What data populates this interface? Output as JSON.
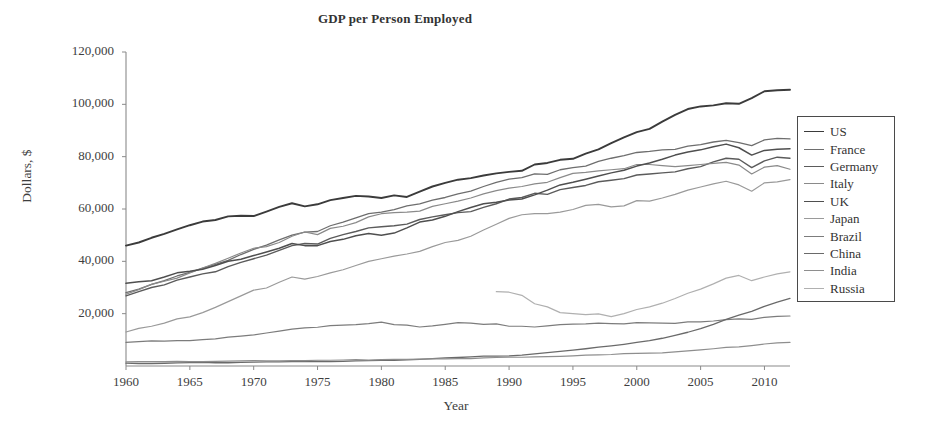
{
  "chart_data": {
    "type": "line",
    "title": "GDP per Person Employed",
    "xlabel": "Year",
    "ylabel": "Dollars, $",
    "xlim": [
      1960,
      2012
    ],
    "ylim": [
      0,
      120000
    ],
    "grid": false,
    "legend_position": "right-outside",
    "xticks": [
      1960,
      1965,
      1970,
      1975,
      1980,
      1985,
      1990,
      1995,
      2000,
      2005,
      2010
    ],
    "xtick_labels": [
      "1960",
      "1965",
      "1970",
      "1975",
      "1980",
      "1985",
      "1990",
      "1995",
      "2000",
      "2005",
      "2010"
    ],
    "yticks": [
      20000,
      40000,
      60000,
      80000,
      100000,
      120000
    ],
    "ytick_labels": [
      "20,000",
      "40,000",
      "60,000",
      "80,000",
      "100,000",
      "120,000"
    ],
    "x": [
      1960,
      1961,
      1962,
      1963,
      1964,
      1965,
      1966,
      1967,
      1968,
      1969,
      1970,
      1971,
      1972,
      1973,
      1974,
      1975,
      1976,
      1977,
      1978,
      1979,
      1980,
      1981,
      1982,
      1983,
      1984,
      1985,
      1986,
      1987,
      1988,
      1989,
      1990,
      1991,
      1992,
      1993,
      1994,
      1995,
      1996,
      1997,
      1998,
      1999,
      2000,
      2001,
      2002,
      2003,
      2004,
      2005,
      2006,
      2007,
      2008,
      2009,
      2010,
      2011,
      2012
    ],
    "series": [
      {
        "name": "US",
        "color": "#3b3b3b",
        "width": 1.9,
        "values": [
          46000,
          47200,
          49000,
          50500,
          52200,
          53800,
          55200,
          55800,
          57200,
          57400,
          57300,
          59000,
          60800,
          62200,
          61000,
          61800,
          63400,
          64200,
          65000,
          64800,
          64200,
          65200,
          64600,
          66600,
          68600,
          70000,
          71200,
          71800,
          72800,
          73600,
          74200,
          74600,
          77000,
          77600,
          78800,
          79200,
          81200,
          82800,
          85200,
          87400,
          89400,
          90600,
          93400,
          96000,
          98200,
          99200,
          99600,
          100400,
          100200,
          102400,
          105000,
          105400,
          105600
        ]
      },
      {
        "name": "France",
        "color": "#6e6e6e",
        "width": 1.3,
        "values": [
          28000,
          29400,
          31200,
          32600,
          34400,
          35800,
          37400,
          38800,
          40400,
          42600,
          44600,
          46200,
          48200,
          50000,
          51200,
          51400,
          53600,
          55000,
          56600,
          58200,
          58800,
          59800,
          61200,
          62000,
          63400,
          64400,
          65800,
          66800,
          68600,
          70200,
          71400,
          72000,
          73400,
          73200,
          75000,
          75800,
          76400,
          78200,
          79400,
          80400,
          81600,
          82000,
          82600,
          82800,
          84000,
          84600,
          85600,
          86200,
          85400,
          84200,
          86400,
          87000,
          86800
        ]
      },
      {
        "name": "Germany",
        "color": "#5b5b5b",
        "width": 1.4,
        "values": [
          26800,
          28400,
          30000,
          31000,
          32800,
          34000,
          35200,
          36000,
          38000,
          39600,
          41000,
          42400,
          44200,
          46000,
          46800,
          46600,
          48800,
          50200,
          51400,
          52800,
          53200,
          53600,
          54200,
          56000,
          57000,
          57800,
          58600,
          59000,
          60600,
          62000,
          63800,
          64400,
          66000,
          65600,
          67400,
          68200,
          69000,
          70400,
          71000,
          71600,
          73000,
          73400,
          73800,
          74200,
          75400,
          76200,
          78000,
          79400,
          79000,
          75800,
          78400,
          79800,
          79400
        ]
      },
      {
        "name": "Italy",
        "color": "#8a8a8a",
        "width": 1.2,
        "values": [
          27400,
          29200,
          31200,
          32400,
          33600,
          35600,
          37400,
          39200,
          41200,
          43200,
          45000,
          45600,
          47200,
          49600,
          51200,
          50200,
          52600,
          53400,
          54800,
          57000,
          58200,
          58600,
          58800,
          59200,
          61000,
          62000,
          63000,
          64200,
          65800,
          67000,
          68000,
          68600,
          69600,
          70200,
          72000,
          73600,
          74000,
          74600,
          75000,
          75400,
          77000,
          77000,
          76600,
          76200,
          76600,
          77000,
          77400,
          77800,
          76800,
          73400,
          76000,
          76600,
          75200
        ]
      },
      {
        "name": "UK",
        "color": "#4f4f4f",
        "width": 1.5,
        "values": [
          31600,
          32200,
          32600,
          34000,
          35600,
          36200,
          37000,
          38400,
          40000,
          40800,
          42200,
          43600,
          45000,
          46800,
          46000,
          46000,
          47600,
          48400,
          49800,
          50600,
          50000,
          50800,
          52800,
          55000,
          55800,
          57200,
          59000,
          60600,
          62000,
          62600,
          63400,
          63800,
          65400,
          67200,
          69200,
          70200,
          71400,
          72600,
          73800,
          74800,
          76400,
          77600,
          79000,
          80600,
          81800,
          82600,
          83800,
          84800,
          83400,
          80600,
          82400,
          82800,
          83000
        ]
      },
      {
        "name": "Japan",
        "color": "#9a9a9a",
        "width": 1.2,
        "values": [
          13000,
          14400,
          15200,
          16400,
          18000,
          18800,
          20400,
          22400,
          24600,
          26800,
          29000,
          29800,
          32000,
          34000,
          33200,
          34200,
          35600,
          36800,
          38400,
          40000,
          41000,
          42000,
          42800,
          43800,
          45600,
          47200,
          48000,
          49600,
          52000,
          54200,
          56400,
          57800,
          58200,
          58200,
          58800,
          59800,
          61400,
          61800,
          60800,
          61200,
          63200,
          63000,
          64200,
          65600,
          67200,
          68400,
          69600,
          70600,
          69200,
          66800,
          70000,
          70400,
          71200
        ]
      },
      {
        "name": "Brazil",
        "color": "#7c7c7c",
        "width": 1.2,
        "values": [
          9000,
          9300,
          9600,
          9500,
          9700,
          9700,
          10100,
          10400,
          11000,
          11400,
          11900,
          12600,
          13300,
          14100,
          14600,
          14800,
          15400,
          15600,
          15800,
          16200,
          16800,
          15800,
          15600,
          14900,
          15300,
          15900,
          16600,
          16400,
          15900,
          16100,
          15200,
          15200,
          14900,
          15300,
          15800,
          16000,
          16100,
          16400,
          16200,
          16100,
          16600,
          16500,
          16400,
          16300,
          16900,
          16900,
          17200,
          17700,
          18000,
          17800,
          18600,
          19000,
          19100
        ]
      },
      {
        "name": "China",
        "color": "#6a6a6a",
        "width": 1.3,
        "values": [
          1100,
          950,
          950,
          1050,
          1200,
          1300,
          1350,
          1250,
          1250,
          1350,
          1500,
          1550,
          1550,
          1650,
          1650,
          1750,
          1700,
          1800,
          1950,
          2050,
          2150,
          2200,
          2350,
          2550,
          2850,
          3100,
          3250,
          3500,
          3750,
          3800,
          3850,
          4150,
          4650,
          5100,
          5600,
          6100,
          6600,
          7200,
          7700,
          8300,
          9000,
          9700,
          10600,
          11700,
          12900,
          14300,
          15900,
          17800,
          19400,
          20900,
          22800,
          24400,
          25800
        ]
      },
      {
        "name": "India",
        "color": "#8e8e8e",
        "width": 1.2,
        "values": [
          1600,
          1650,
          1650,
          1700,
          1800,
          1700,
          1700,
          1800,
          1850,
          1950,
          2050,
          2000,
          2000,
          2050,
          2050,
          2200,
          2200,
          2300,
          2400,
          2250,
          2400,
          2500,
          2500,
          2650,
          2700,
          2750,
          2850,
          2850,
          3100,
          3250,
          3400,
          3350,
          3450,
          3550,
          3700,
          3900,
          4150,
          4250,
          4400,
          4700,
          4800,
          4950,
          5050,
          5400,
          5750,
          6150,
          6600,
          7100,
          7300,
          7800,
          8400,
          8800,
          9000
        ]
      },
      {
        "name": "Russia",
        "color": "#b0b0b0",
        "width": 1.2,
        "values": [
          null,
          null,
          null,
          null,
          null,
          null,
          null,
          null,
          null,
          null,
          null,
          null,
          null,
          null,
          null,
          null,
          null,
          null,
          null,
          null,
          null,
          null,
          null,
          null,
          null,
          null,
          null,
          null,
          null,
          28400,
          28200,
          27000,
          23800,
          22600,
          20400,
          20000,
          19600,
          19900,
          18900,
          20000,
          21600,
          22600,
          24000,
          25800,
          27800,
          29400,
          31400,
          33600,
          34600,
          32600,
          34000,
          35200,
          36000
        ]
      }
    ]
  }
}
